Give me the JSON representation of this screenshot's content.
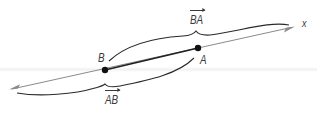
{
  "diagram": {
    "title": "",
    "axis_label": "x",
    "points": [
      {
        "id": "B",
        "label": "B"
      },
      {
        "id": "A",
        "label": "A"
      }
    ],
    "vectors": [
      {
        "id": "BA",
        "label": "BA",
        "from": "B",
        "to": "A",
        "position": "above"
      },
      {
        "id": "AB",
        "label": "AB",
        "from": "A",
        "to": "B",
        "position": "below"
      }
    ],
    "colors": {
      "axis_line": "#8a8a8a",
      "segment": "#1f1f1f",
      "point": "#111111",
      "brace": "#2a2a2a",
      "text": "#3a3a3a"
    }
  }
}
